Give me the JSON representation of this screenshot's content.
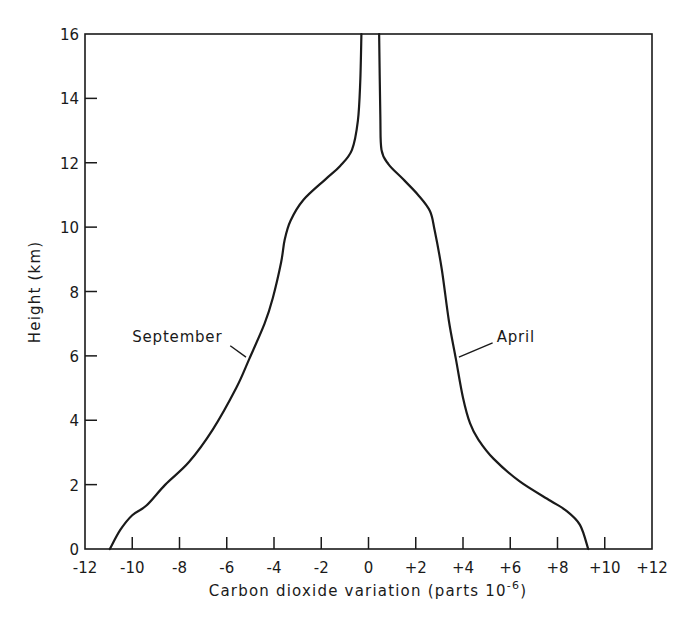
{
  "chart_data": {
    "type": "line",
    "title": "",
    "xlabel": "Carbon dioxide variation (parts 10",
    "xlabel_superscript": "-6",
    "xlabel_suffix": ")",
    "ylabel": "Height (km)",
    "xlim": [
      -12,
      12
    ],
    "ylim": [
      0,
      16
    ],
    "grid": false,
    "legend": "none",
    "x_ticks": [
      -12,
      -10,
      -8,
      -6,
      -4,
      -2,
      0,
      2,
      4,
      6,
      8,
      10,
      12
    ],
    "x_tick_labels": [
      "-12",
      "-10",
      "-8",
      "-6",
      "-4",
      "-2",
      "0",
      "+2",
      "+4",
      "+6",
      "+8",
      "+10",
      "+12"
    ],
    "y_ticks": [
      0,
      2,
      4,
      6,
      8,
      10,
      12,
      14,
      16
    ],
    "y_tick_labels": [
      "0",
      "2",
      "4",
      "6",
      "8",
      "10",
      "12",
      "14",
      "16"
    ],
    "line_color": "#1a1a1a",
    "series": [
      {
        "name": "September",
        "points": [
          [
            -10.95,
            0
          ],
          [
            -10.5,
            0.6
          ],
          [
            -10.0,
            1.05
          ],
          [
            -9.4,
            1.35
          ],
          [
            -8.6,
            2.0
          ],
          [
            -7.6,
            2.7
          ],
          [
            -6.6,
            3.7
          ],
          [
            -5.6,
            5.0
          ],
          [
            -5.05,
            5.9
          ],
          [
            -4.4,
            7.0
          ],
          [
            -4.05,
            7.8
          ],
          [
            -3.7,
            8.9
          ],
          [
            -3.55,
            9.6
          ],
          [
            -3.3,
            10.2
          ],
          [
            -2.75,
            10.85
          ],
          [
            -1.8,
            11.5
          ],
          [
            -1.2,
            11.9
          ],
          [
            -0.7,
            12.4
          ],
          [
            -0.45,
            13.3
          ],
          [
            -0.35,
            14.5
          ],
          [
            -0.3,
            16
          ]
        ]
      },
      {
        "name": "April",
        "points": [
          [
            9.3,
            0
          ],
          [
            8.95,
            0.75
          ],
          [
            8.35,
            1.2
          ],
          [
            7.7,
            1.5
          ],
          [
            6.4,
            2.1
          ],
          [
            5.3,
            2.8
          ],
          [
            4.65,
            3.4
          ],
          [
            4.3,
            3.9
          ],
          [
            4.0,
            4.7
          ],
          [
            3.7,
            5.9
          ],
          [
            3.4,
            7.1
          ],
          [
            3.1,
            8.7
          ],
          [
            2.8,
            9.9
          ],
          [
            2.6,
            10.5
          ],
          [
            2.1,
            11.0
          ],
          [
            1.45,
            11.5
          ],
          [
            0.85,
            11.95
          ],
          [
            0.55,
            12.4
          ],
          [
            0.5,
            13.5
          ],
          [
            0.45,
            16
          ]
        ]
      }
    ],
    "annotations": [
      {
        "text": "September",
        "series": "September",
        "at": [
          -5.1,
          5.9
        ],
        "label_pos": [
          -10.0,
          6.5
        ]
      },
      {
        "text": "April",
        "series": "April",
        "at": [
          3.7,
          5.9
        ],
        "label_pos": [
          5.0,
          6.5
        ]
      }
    ]
  }
}
